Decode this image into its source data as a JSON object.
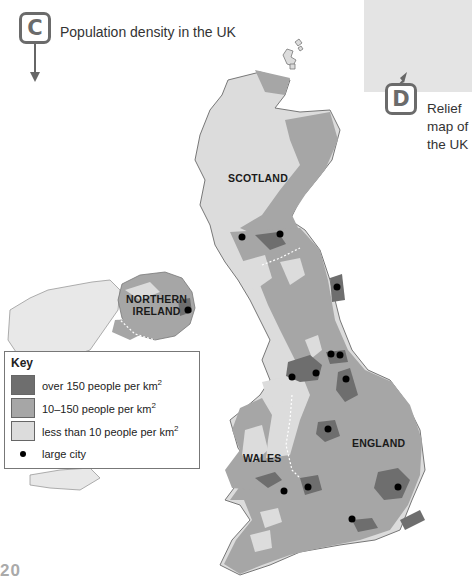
{
  "figure_c": {
    "badge": "C",
    "title": "Population density in the UK"
  },
  "figure_d": {
    "badge": "D",
    "title": "Relief map of the UK"
  },
  "regions": {
    "scotland": "SCOTLAND",
    "northern_ireland_line1": "NORTHERN",
    "northern_ireland_line2": "IRELAND",
    "wales": "WALES",
    "england": "ENGLAND"
  },
  "key": {
    "title": "Key",
    "items": [
      {
        "label": "over 150 people per km",
        "sup": "2",
        "color": "#6e6e6e"
      },
      {
        "label": "10–150 people per km",
        "sup": "2",
        "color": "#a6a6a6"
      },
      {
        "label": "less than 10 people per km",
        "sup": "2",
        "color": "#dcdcdc"
      },
      {
        "label": "large city",
        "sup": "",
        "color": "#000000"
      }
    ]
  },
  "colors": {
    "high_density": "#6e6e6e",
    "medium_density": "#a6a6a6",
    "low_density": "#dcdcdc",
    "relief_panel": "#e4e4e4",
    "badge_border": "#6b6b6b"
  },
  "page_number": "20"
}
